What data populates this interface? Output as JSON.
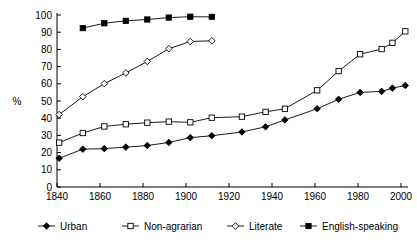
{
  "chart_data": {
    "type": "line",
    "title": "",
    "subtitle": "",
    "xlabel": "",
    "ylabel": "%",
    "xlim": [
      1840,
      2003
    ],
    "ylim": [
      0,
      100
    ],
    "grid": false,
    "legend_position": "bottom",
    "x_ticks": [
      1840,
      1860,
      1880,
      1900,
      1920,
      1940,
      1960,
      1980,
      2000
    ],
    "x_tick_labels": [
      "1840",
      "1860",
      "1880",
      "1900",
      "1920",
      "1940",
      "1960",
      "1980",
      "2000"
    ],
    "y_ticks": [
      0,
      10,
      20,
      30,
      40,
      50,
      60,
      70,
      80,
      90,
      100
    ],
    "y_tick_labels": [
      "0",
      "10",
      "20",
      "30",
      "40",
      "50",
      "60",
      "70",
      "80",
      "90",
      "100"
    ],
    "series": [
      {
        "name": "Urban",
        "marker": "filled-diamond",
        "x": [
          1841,
          1852,
          1862,
          1872,
          1882,
          1892,
          1902,
          1912,
          1926,
          1937,
          1946,
          1961,
          1971,
          1981,
          1991,
          1996,
          2002
        ],
        "values": [
          16.7,
          22.0,
          22.3,
          23.2,
          24.1,
          25.9,
          28.7,
          29.8,
          32.0,
          35.0,
          39.0,
          45.5,
          51.0,
          55.0,
          55.6,
          57.5,
          59.0
        ]
      },
      {
        "name": "Non-agrarian",
        "marker": "open-square",
        "x": [
          1841,
          1852,
          1862,
          1872,
          1882,
          1892,
          1902,
          1912,
          1926,
          1937,
          1946,
          1961,
          1971,
          1981,
          1991,
          1996,
          2002
        ],
        "values": [
          25.8,
          31.4,
          35.2,
          36.5,
          37.4,
          38.0,
          37.6,
          40.3,
          40.9,
          43.7,
          45.5,
          56.2,
          67.4,
          77.2,
          80.2,
          83.8,
          90.5
        ]
      },
      {
        "name": "Literate",
        "marker": "open-diamond",
        "x": [
          1841,
          1852,
          1862,
          1872,
          1882,
          1892,
          1902,
          1912
        ],
        "values": [
          42.1,
          52.5,
          60.1,
          66.3,
          73.0,
          80.4,
          84.6,
          85.0
        ]
      },
      {
        "name": "English-speaking",
        "marker": "filled-square",
        "x": [
          1852,
          1862,
          1872,
          1882,
          1892,
          1902,
          1912
        ],
        "values": [
          92.4,
          95.2,
          96.6,
          97.4,
          98.5,
          99.0,
          98.9
        ]
      }
    ]
  },
  "legend": {
    "items": [
      {
        "label": "Urban",
        "marker": "filled-diamond"
      },
      {
        "label": "Non-agrarian",
        "marker": "open-square"
      },
      {
        "label": "Literate",
        "marker": "open-diamond"
      },
      {
        "label": "English-speaking",
        "marker": "filled-square"
      }
    ]
  },
  "colors": {
    "foreground": "#000000",
    "background": "#ffffff"
  }
}
